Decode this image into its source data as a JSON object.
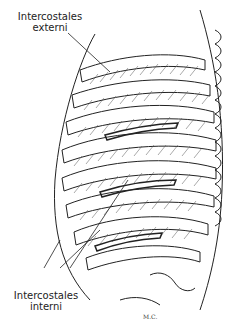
{
  "diagram": {
    "labels": {
      "top": {
        "line1": "Intercostales",
        "line2": "externi"
      },
      "bottom": {
        "line1": "Intercostales",
        "line2": "interni"
      }
    },
    "signature": "M.C."
  }
}
